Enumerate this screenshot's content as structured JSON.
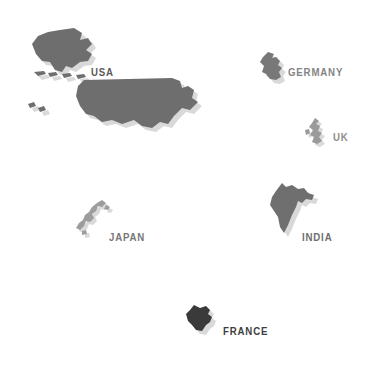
{
  "figure": {
    "type": "country-silhouette-map",
    "background_color": "#ffffff",
    "width": 386,
    "height": 384,
    "shadow_color": "#d9d9d9",
    "shadow_offset": {
      "x": 4,
      "y": 4
    }
  },
  "countries": [
    {
      "id": "usa",
      "label": "USA",
      "fill": "#6e6e6e",
      "label_color": "#5a5a5a",
      "label_x": 91,
      "label_y": 66,
      "shape_x": 22,
      "shape_y": 28
    },
    {
      "id": "germany",
      "label": "GERMANY",
      "fill": "#787878",
      "label_color": "#848484",
      "label_x": 288,
      "label_y": 66,
      "shape_x": 258,
      "shape_y": 52
    },
    {
      "id": "uk",
      "label": "UK",
      "fill": "#9a9a9a",
      "label_color": "#8e8e8e",
      "label_x": 333,
      "label_y": 131,
      "shape_x": 305,
      "shape_y": 118
    },
    {
      "id": "india",
      "label": "INDIA",
      "fill": "#6f6f6f",
      "label_color": "#6e6e6e",
      "label_x": 302,
      "label_y": 231,
      "shape_x": 268,
      "shape_y": 183
    },
    {
      "id": "japan",
      "label": "JAPAN",
      "fill": "#9d9d9d",
      "label_color": "#777777",
      "label_x": 109,
      "label_y": 231,
      "shape_x": 76,
      "shape_y": 200
    },
    {
      "id": "france",
      "label": "FRANCE",
      "fill": "#3a3a3a",
      "label_color": "#3f3f3f",
      "label_x": 223,
      "label_y": 325,
      "shape_x": 186,
      "shape_y": 305
    }
  ]
}
